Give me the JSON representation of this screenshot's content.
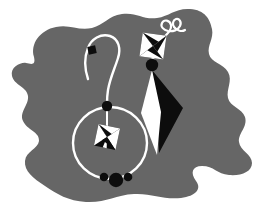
{
  "artwork": {
    "title": "Pair of earrings illustration",
    "description": "Black and white stylized jewelry illustration on an irregular gray blob background",
    "width": 261,
    "height": 219,
    "canvas_background": "#ffffff"
  },
  "palette": {
    "background_blob": "#666666",
    "ink_black": "#0d0d0d",
    "highlight_white": "#ffffff",
    "page_white": "#ffffff"
  },
  "background": {
    "shape_name": "blob",
    "fill": "#666666",
    "path": "M 34 57 C 30 44 40 30 56 27 C 70 24 78 31 92 28 C 104 25 108 16 122 14 C 137 12 143 20 157 18 C 170 16 175 8 190 9 C 205 10 210 19 212 29 C 214 39 207 45 209 54 C 211 63 223 63 228 72 C 233 81 226 89 228 98 C 230 107 242 108 245 117 C 248 127 238 133 239 142 C 240 151 252 154 252 163 C 252 172 241 176 229 175 C 217 174 214 166 202 166 C 192 166 190 173 196 181 C 202 189 196 196 181 198 C 163 200 152 193 134 194 C 115 195 106 203 86 202 C 68 201 57 194 45 186 C 33 178 24 171 25 161 C 26 151 38 149 39 141 C 40 132 27 130 23 121 C 19 112 29 105 28 96 C 27 87 14 85 12 76 C 10 67 21 62 26 63 C 31 64 36 66 34 57 Z"
  },
  "earring_left": {
    "name": "hoop-earring",
    "parts": {
      "hook_wire": {
        "name": "ear-wire-hook",
        "stroke": "#ffffff",
        "stroke_width": 2.4,
        "path": "M 88 79 C 85 70 84 58 88 48 C 91 39 101 33 110 36 C 119 39 121 49 118 58 C 115 68 110 78 108 90 C 107 96 107 100 107 104"
      },
      "square_bead": {
        "name": "square-bead",
        "fill": "#0d0d0d",
        "x": 88,
        "y": 46,
        "size": 8,
        "rotation": -12
      },
      "top_bead": {
        "name": "hoop-top-bead",
        "fill": "#0d0d0d",
        "cx": 107,
        "cy": 106,
        "r": 5.2
      },
      "hoop_ring": {
        "name": "hoop-ring",
        "stroke": "#ffffff",
        "stroke_width": 2.4,
        "cx": 110,
        "cy": 143,
        "rx": 37,
        "ry": 36
      },
      "drop_wire": {
        "name": "center-drop-wire",
        "stroke": "#ffffff",
        "stroke_width": 2,
        "path": "M 107 108 L 107 126"
      },
      "star_ornament": {
        "name": "pinwheel-star-ornament",
        "cx": 107,
        "cy": 137,
        "size": 15,
        "rotation": 12
      },
      "bottom_beads": [
        {
          "name": "bead-small-left",
          "cx": 104,
          "cy": 177,
          "r": 4.3,
          "fill": "#0d0d0d"
        },
        {
          "name": "bead-large-center",
          "cx": 116,
          "cy": 180,
          "r": 7.2,
          "fill": "#0d0d0d"
        },
        {
          "name": "bead-small-right",
          "cx": 128,
          "cy": 177,
          "r": 4.3,
          "fill": "#0d0d0d"
        }
      ]
    }
  },
  "earring_right": {
    "name": "kite-pendant-earring",
    "parts": {
      "curl_hook": {
        "name": "curl-ear-hook",
        "stroke": "#ffffff",
        "stroke_width": 2.2,
        "path": "M 161 39 C 167 35 172 30 171 25 C 170 20 164 19 162 23 C 160 27 164 30 168 31 C 173 32 178 30 180 26 C 182 22 179 18 176 19 C 173 20 172 24 174 27 C 177 31 182 32 185 30"
      },
      "star_ornament": {
        "name": "pinwheel-star-ornament",
        "cx": 153,
        "cy": 46,
        "size": 16,
        "rotation": 8
      },
      "connector_arrow": {
        "name": "connector-stem",
        "fill": "#ffffff",
        "path": "M 150 52 L 156 52 L 156 61 L 150 61 Z"
      },
      "top_bead": {
        "name": "pendant-top-bead",
        "fill": "#0d0d0d",
        "cx": 152,
        "cy": 65,
        "r": 6.2
      },
      "kite_white": {
        "name": "kite-facet-white",
        "fill": "#ffffff",
        "path": "M 152 70 L 141 113 L 157 155 L 161 112 Z"
      },
      "kite_white_wing": {
        "name": "kite-facet-white-wing",
        "fill": "#ffffff",
        "path": "M 152 70 L 141 113 L 157 155 L 157 155 L 146 118 Z"
      },
      "kite_black": {
        "name": "kite-facet-black",
        "fill": "#0d0d0d",
        "path": "M 152 70 L 183 108 L 159 153 L 157 112 Z"
      }
    }
  },
  "labels": {
    "alt_text": "Two decorative earrings rendered in black and white over a gray organic background shape"
  }
}
